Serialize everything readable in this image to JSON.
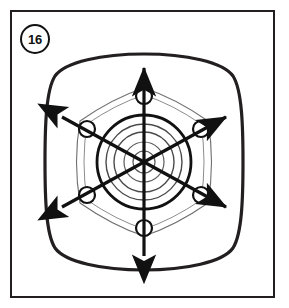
{
  "figure": {
    "step_number": "16",
    "caption": "",
    "frame": {
      "x": 10,
      "y": 10,
      "width": 265,
      "height": 288,
      "border_color": "#231f20",
      "border_width": 2
    },
    "colors": {
      "ink": "#111111",
      "outline": "#231f20",
      "faint_line": "#6b6b6b",
      "background": "#ffffff"
    }
  },
  "illustration": {
    "subject": "wheel-hub-lug-nut-tightening-sequence",
    "wheel_cover": {
      "name": "rounded-square-wheel-cover",
      "center_x": 144,
      "center_y": 162,
      "half_width": 96,
      "half_height": 108,
      "corner_radius": 60,
      "stroke_width": 3
    },
    "hub": {
      "name": "center-hub",
      "center_x": 144,
      "center_y": 162,
      "rings": [
        {
          "radius": 47,
          "stroke_width": 2.6
        },
        {
          "radius": 38,
          "stroke_width": 1.4
        },
        {
          "radius": 30,
          "stroke_width": 1.4
        },
        {
          "radius": 20,
          "stroke_width": 1.2
        },
        {
          "radius": 11,
          "stroke_width": 1.2
        }
      ]
    },
    "lug_nuts": {
      "count": 6,
      "hole_radius": 8,
      "bolt_circle_radius": 66,
      "positions": [
        {
          "label": "top",
          "angle_deg": 270,
          "x": 144,
          "y": 96
        },
        {
          "label": "upper-right",
          "angle_deg": 330,
          "x": 201,
          "y": 129
        },
        {
          "label": "lower-right",
          "angle_deg": 30,
          "x": 201,
          "y": 195
        },
        {
          "label": "bottom",
          "angle_deg": 90,
          "x": 144,
          "y": 228
        },
        {
          "label": "lower-left",
          "angle_deg": 150,
          "x": 87,
          "y": 195
        },
        {
          "label": "upper-left",
          "angle_deg": 210,
          "x": 87,
          "y": 129
        }
      ]
    },
    "spoke_hexagon": {
      "name": "hexagonal-spoke-outline",
      "vertex_radius": 74,
      "bulge": 9,
      "stroke_width": 1.1
    },
    "sequence_arrows": {
      "count": 3,
      "description": "three double-headed arrows forming a six-point star tightening pattern across opposite lug nuts",
      "stroke_width": 3.2,
      "head_length": 15,
      "head_width": 11,
      "arrows": [
        {
          "name": "vertical-arrow",
          "x1": 144,
          "y1": 256,
          "x2": 144,
          "y2": 68
        },
        {
          "name": "diagonal-arrow-a",
          "x1": 62,
          "y1": 207,
          "x2": 226,
          "y2": 117
        },
        {
          "name": "diagonal-arrow-b",
          "x1": 62,
          "y1": 117,
          "x2": 226,
          "y2": 207
        }
      ]
    }
  }
}
